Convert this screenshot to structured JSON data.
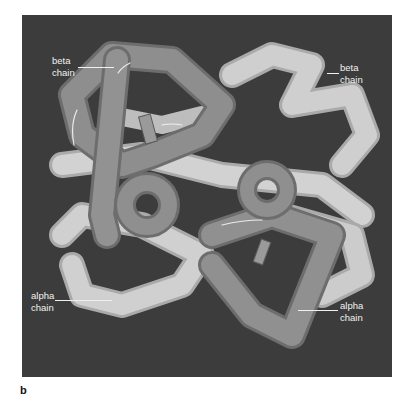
{
  "figure": {
    "panel_letter": "b",
    "labels": [
      {
        "line1": "beta",
        "line2": "chain",
        "position": "top-left"
      },
      {
        "line1": "beta",
        "line2": "chain",
        "position": "top-right"
      },
      {
        "line1": "alpha",
        "line2": "chain",
        "position": "bottom-left"
      },
      {
        "line1": "alpha",
        "line2": "chain",
        "position": "bottom-right"
      }
    ]
  },
  "colors": {
    "background": "#3c3c3c",
    "dark_chain": "#8a8a8a",
    "light_chain": "#c9c9c9",
    "label_text": "#f2f2f2"
  }
}
